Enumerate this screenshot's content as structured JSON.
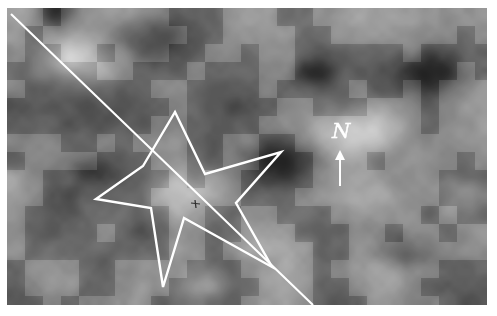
{
  "figure": {
    "kind": "grayscale-raster-image",
    "frame": {
      "x": 7,
      "y": 8,
      "width": 480,
      "height": 297
    },
    "background_color": "#8d8d8d",
    "page_background": "#ffffff"
  },
  "overlays": {
    "annotation_color": "#ffffff",
    "transect_line": {
      "label": "diagonal-transect-line",
      "start": {
        "x": 4,
        "y": 6
      },
      "end": {
        "x": 306,
        "y": 297
      },
      "stroke": "#ffffff",
      "width": 2.1
    },
    "star_outline": {
      "label": "five-pointed-star-outline",
      "stroke": "#ffffff",
      "width": 2.4,
      "points": "168,104 198,166 274,144 229,195 265,259 177,210 156,279 144,200 89,191 136,158"
    },
    "center_tick": {
      "label": "center-tick-mark",
      "x": 188,
      "y": 197,
      "stroke": "#2e2e2e"
    }
  },
  "north_indicator": {
    "letter": "N",
    "letter_style": "calligraphic-italic",
    "letter_position": {
      "x": 325,
      "y": 130
    },
    "arrow_direction": "up",
    "arrow_tip": {
      "x": 333,
      "y": 142
    },
    "arrow_tail": {
      "x": 333,
      "y": 178
    },
    "color": "#ffffff"
  },
  "raster": {
    "seed": 20240517,
    "block_size": 18,
    "sub_block_size": 6,
    "smoothing": "bilinear",
    "tone_min": 38,
    "tone_max": 232,
    "hotspots": [
      {
        "x": 0.14,
        "y": 0.18,
        "r": 0.09,
        "value": 1.0
      },
      {
        "x": 0.73,
        "y": 0.42,
        "r": 0.11,
        "value": 0.92
      },
      {
        "x": 0.41,
        "y": 0.95,
        "r": 0.07,
        "value": 0.95
      },
      {
        "x": 0.36,
        "y": 0.62,
        "r": 0.1,
        "value": 0.82
      },
      {
        "x": 0.97,
        "y": 0.63,
        "r": 0.07,
        "value": 0.88
      }
    ],
    "coldspots": [
      {
        "x": 0.3,
        "y": 0.1,
        "r": 0.1,
        "value": 0.04
      },
      {
        "x": 0.56,
        "y": 0.52,
        "r": 0.09,
        "value": 0.1
      },
      {
        "x": 0.88,
        "y": 0.22,
        "r": 0.09,
        "value": 0.06
      },
      {
        "x": 0.11,
        "y": 0.02,
        "r": 0.05,
        "value": 0.05
      },
      {
        "x": 0.64,
        "y": 0.22,
        "r": 0.05,
        "value": 0.12
      },
      {
        "x": 0.83,
        "y": 0.83,
        "r": 0.07,
        "value": 0.14
      },
      {
        "x": 0.18,
        "y": 0.55,
        "r": 0.06,
        "value": 0.18
      }
    ]
  }
}
